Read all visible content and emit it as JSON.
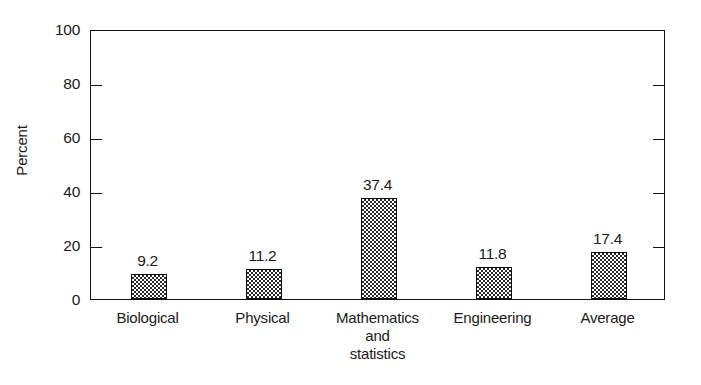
{
  "chart_data": {
    "type": "bar",
    "title": "",
    "subtitle": "",
    "xlabel": "",
    "ylabel": "Percent",
    "ylim": [
      0,
      100
    ],
    "yticks": [
      0,
      20,
      40,
      60,
      80,
      100
    ],
    "ytick_labels": [
      "0",
      "20",
      "40",
      "60",
      "80",
      "100"
    ],
    "grid": false,
    "legend": false,
    "legend_position": "none",
    "bar_fill": "checkerboard-dither",
    "bar_edge_color": "#0d0d0d",
    "background_color": "#ffffff",
    "axis_color": "#111111",
    "tick_direction": "in",
    "frame": "box",
    "categories": [
      "Biological",
      "Physical",
      "Mathematics\nand\nstatistics",
      "Engineering",
      "Average"
    ],
    "values": [
      9.2,
      11.2,
      37.4,
      11.8,
      17.4
    ],
    "value_labels": [
      "9.2",
      "11.2",
      "37.4",
      "11.8",
      "17.4"
    ]
  }
}
